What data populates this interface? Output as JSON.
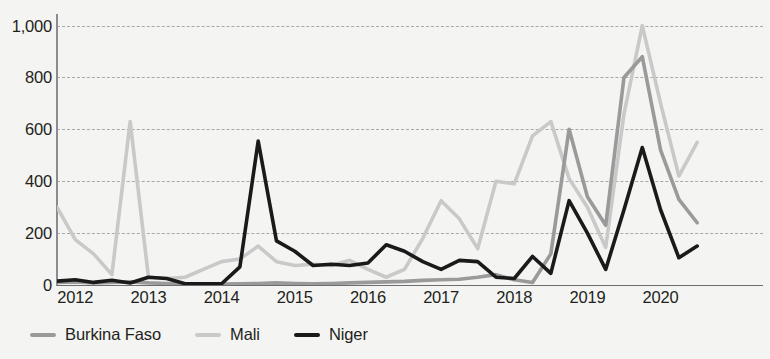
{
  "chart_data": {
    "type": "line",
    "title": "",
    "xlabel": "",
    "ylabel": "",
    "grid": true,
    "legend_position": "bottom-left",
    "ylim": [
      0,
      1060
    ],
    "yticks": [
      0,
      200,
      400,
      600,
      800,
      1000
    ],
    "ytick_labels": [
      "0",
      "200",
      "400",
      "600",
      "800",
      "1,000"
    ],
    "xlim": [
      2011.75,
      2021.4
    ],
    "xticks": [
      2012,
      2013,
      2014,
      2015,
      2016,
      2017,
      2018,
      2019,
      2020
    ],
    "xtick_labels": [
      "2012",
      "2013",
      "2014",
      "2015",
      "2016",
      "2017",
      "2018",
      "2019",
      "2020"
    ],
    "x": [
      2011.75,
      2012.0,
      2012.25,
      2012.5,
      2012.75,
      2013.0,
      2013.25,
      2013.5,
      2013.75,
      2014.0,
      2014.25,
      2014.5,
      2014.75,
      2015.0,
      2015.25,
      2015.5,
      2015.75,
      2016.0,
      2016.25,
      2016.5,
      2016.75,
      2017.0,
      2017.25,
      2017.5,
      2017.75,
      2018.0,
      2018.25,
      2018.5,
      2018.75,
      2019.0,
      2019.25,
      2019.5,
      2019.75,
      2020.0,
      2020.25,
      2020.5
    ],
    "series": [
      {
        "name": "Burkina Faso",
        "color": "#9a9a9a",
        "values": [
          10,
          12,
          8,
          10,
          12,
          8,
          6,
          5,
          5,
          4,
          5,
          6,
          8,
          6,
          5,
          6,
          8,
          10,
          12,
          14,
          18,
          20,
          22,
          30,
          40,
          20,
          10,
          120,
          600,
          340,
          230,
          800,
          880,
          520,
          330,
          240
        ]
      },
      {
        "name": "Mali",
        "color": "#c9c9c9",
        "values": [
          300,
          175,
          120,
          40,
          630,
          30,
          25,
          30,
          60,
          90,
          100,
          150,
          90,
          75,
          80,
          75,
          95,
          60,
          30,
          60,
          180,
          325,
          255,
          140,
          400,
          390,
          575,
          630,
          410,
          300,
          145,
          660,
          1000,
          700,
          420,
          550
        ]
      },
      {
        "name": "Niger",
        "color": "#1a1a1a",
        "values": [
          15,
          20,
          10,
          18,
          8,
          30,
          25,
          5,
          5,
          5,
          70,
          555,
          170,
          130,
          75,
          80,
          75,
          85,
          155,
          130,
          90,
          60,
          95,
          90,
          30,
          25,
          110,
          45,
          325,
          200,
          60,
          290,
          530,
          290,
          105,
          150
        ]
      }
    ]
  },
  "legend": {
    "items": [
      {
        "label": "Burkina Faso",
        "color": "#9a9a9a"
      },
      {
        "label": "Mali",
        "color": "#c9c9c9"
      },
      {
        "label": "Niger",
        "color": "#1a1a1a"
      }
    ]
  }
}
